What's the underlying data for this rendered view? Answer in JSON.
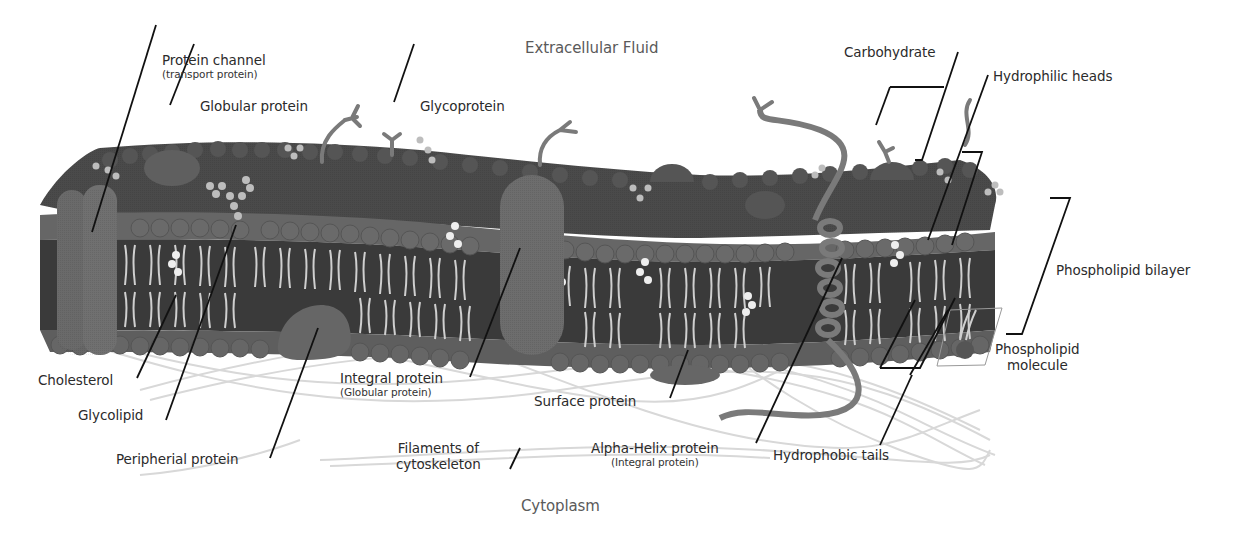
{
  "diagram": {
    "type": "labeled-illustration",
    "regions": {
      "top": "Extracellular Fluid",
      "bottom": "Cytoplasm"
    },
    "labels": {
      "protein_channel": {
        "title": "Protein channel",
        "subtitle": "(transport protein)"
      },
      "globular_protein": {
        "title": "Globular protein"
      },
      "glycoprotein": {
        "title": "Glycoprotein"
      },
      "carbohydrate": {
        "title": "Carbohydrate"
      },
      "hydrophilic_heads": {
        "title": "Hydrophilic heads"
      },
      "phospholipid_bilayer": {
        "title": "Phospholipid bilayer"
      },
      "phospholipid_molecule": {
        "line1": "Phospholipid",
        "line2": "molecule"
      },
      "cholesterol": {
        "title": "Cholesterol"
      },
      "glycolipid": {
        "title": "Glycolipid"
      },
      "peripheral_protein": {
        "title": "Peripherial protein"
      },
      "integral_protein": {
        "title": "Integral protein",
        "subtitle": "(Globular protein)"
      },
      "surface_protein": {
        "title": "Surface protein"
      },
      "filaments": {
        "line1": "Filaments of",
        "line2": "cytoskeleton"
      },
      "alpha_helix": {
        "title": "Alpha-Helix protein",
        "subtitle": "(Integral protein)"
      },
      "hydrophobic_tails": {
        "title": "Hydrophobic tails"
      }
    },
    "colors": {
      "background": "#ffffff",
      "head_dark": "#4a4a4a",
      "head_mid": "#626262",
      "head_light": "#7a7a7a",
      "protein": "#6e6e6e",
      "tail": "#cfcfcf",
      "core": "#3a3a3a",
      "filament": "#d6d6d6",
      "leader_line": "#111111",
      "text": "#2b2b2b"
    }
  }
}
